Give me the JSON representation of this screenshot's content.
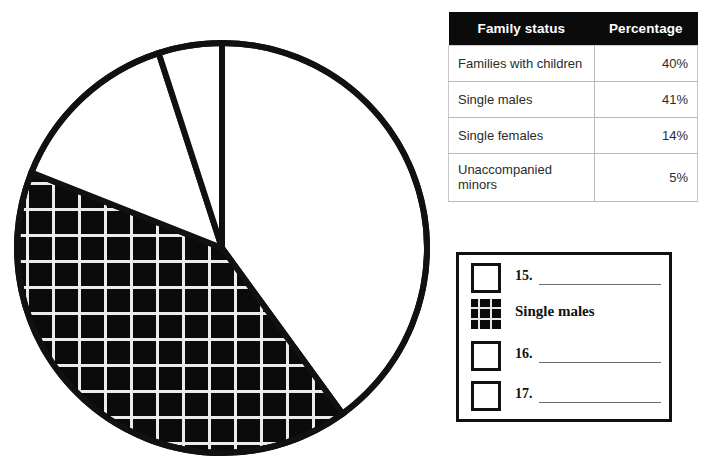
{
  "chart_data": {
    "type": "pie",
    "title": "",
    "categories": [
      "Families with children",
      "Single males",
      "Single females",
      "Unaccompanied minors"
    ],
    "values": [
      40,
      41,
      14,
      5
    ],
    "units": "%",
    "legend_position": "right",
    "grid": false,
    "slices": [
      {
        "label": "Families with children",
        "value": 40,
        "fill": "white",
        "start_deg": 0,
        "end_deg": 144
      },
      {
        "label": "Single males",
        "value": 41,
        "fill": "hatched",
        "start_deg": 144,
        "end_deg": 291.6
      },
      {
        "label": "Single females",
        "value": 14,
        "fill": "white",
        "start_deg": 291.6,
        "end_deg": 342
      },
      {
        "label": "Unaccompanied minors",
        "value": 5,
        "fill": "white",
        "start_deg": 342,
        "end_deg": 360
      }
    ],
    "geometry": {
      "cx": 222,
      "cy": 248,
      "r": 205,
      "stroke": "#111111",
      "stroke_width": 6
    }
  },
  "table": {
    "headers": [
      "Family status",
      "Percentage"
    ],
    "rows": [
      {
        "status": "Families with children",
        "percentage": "40%"
      },
      {
        "status": "Single males",
        "percentage": "41%"
      },
      {
        "status": "Single females",
        "percentage": "14%"
      },
      {
        "status": "Unaccompanied minors",
        "percentage": "5%"
      }
    ]
  },
  "legend": {
    "items": [
      {
        "marker": "empty-square",
        "number": "15.",
        "text": "",
        "has_answer_line": true
      },
      {
        "marker": "hatched-square",
        "number": "",
        "text": "Single males",
        "has_answer_line": false
      },
      {
        "marker": "empty-square",
        "number": "16.",
        "text": "",
        "has_answer_line": true
      },
      {
        "marker": "empty-square",
        "number": "17.",
        "text": "",
        "has_answer_line": true
      }
    ]
  },
  "colors": {
    "ink": "#111111",
    "header_bg": "#0b0b0b",
    "header_fg": "#ffffff",
    "rule": "#b9b9b9",
    "hatch_line": "#e8e8e8",
    "page_bg": "#ffffff"
  }
}
